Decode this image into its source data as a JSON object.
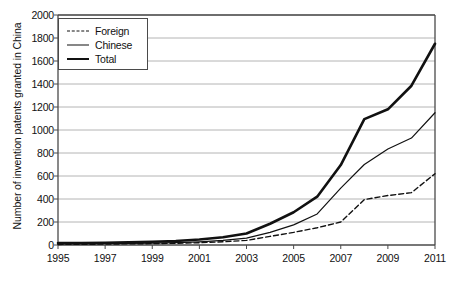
{
  "chart_data": {
    "type": "line",
    "title": "",
    "xlabel": "",
    "ylabel": "Number of invention patents granted in China",
    "xlim": [
      1995,
      2011
    ],
    "ylim": [
      0,
      2000
    ],
    "ytick_step": 200,
    "grid": true,
    "legend_position": "top-left-inside",
    "x": [
      1995,
      1996,
      1997,
      1998,
      1999,
      2000,
      2001,
      2002,
      2003,
      2004,
      2005,
      2006,
      2007,
      2008,
      2009,
      2010,
      2011
    ],
    "xtick_labels": [
      "1995",
      "1997",
      "1999",
      "2001",
      "2003",
      "2005",
      "2007",
      "2009",
      "2011"
    ],
    "ytick_labels": [
      "0",
      "200",
      "400",
      "600",
      "800",
      "1000",
      "1200",
      "1400",
      "1600",
      "1800",
      "2000"
    ],
    "series": [
      {
        "name": "Foreign",
        "style": "dashed",
        "values": [
          5,
          6,
          8,
          10,
          12,
          15,
          20,
          28,
          40,
          75,
          110,
          150,
          200,
          395,
          430,
          455,
          620
        ]
      },
      {
        "name": "Chinese",
        "style": "thin-solid",
        "values": [
          10,
          10,
          12,
          14,
          16,
          20,
          28,
          40,
          60,
          110,
          175,
          270,
          495,
          700,
          835,
          930,
          1150
        ]
      },
      {
        "name": "Total",
        "style": "thick-solid",
        "values": [
          18,
          18,
          20,
          24,
          28,
          35,
          48,
          68,
          100,
          185,
          285,
          420,
          695,
          1095,
          1180,
          1385,
          1750
        ]
      }
    ]
  },
  "legend": {
    "items": [
      {
        "label": "Foreign"
      },
      {
        "label": "Chinese"
      },
      {
        "label": "Total"
      }
    ]
  },
  "colors": {
    "line": "#111111",
    "grid": "#b4b4b4",
    "axis": "#4a4a4a",
    "background": "#ffffff"
  }
}
